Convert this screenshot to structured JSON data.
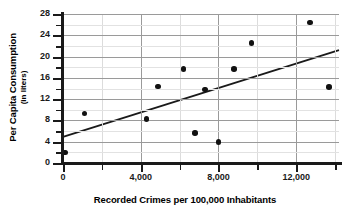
{
  "chart_data": {
    "type": "scatter",
    "title": "",
    "xlabel": "Recorded Crimes per 100,000 Inhabitants",
    "ylabel": "Per Capita Consumption",
    "ylabel_sub": "(in liters)",
    "xlim": [
      0,
      14200
    ],
    "ylim": [
      0,
      28
    ],
    "xticks": [
      0,
      4000,
      8000,
      12000
    ],
    "xtick_labels": [
      "0",
      "4,000",
      "8,000",
      "12,000"
    ],
    "xminor_ticks": [
      2000,
      6000,
      10000,
      14000
    ],
    "yticks": [
      0,
      4,
      8,
      12,
      16,
      20,
      24,
      28
    ],
    "ytick_labels": [
      "0",
      "4",
      "8",
      "12",
      "16",
      "20",
      "24",
      "28"
    ],
    "yminor_ticks": [
      2,
      6,
      10,
      14,
      18,
      22,
      26
    ],
    "grid": true,
    "legend": "none",
    "marker_color": "#111111",
    "grid_color": "#c9c9c9",
    "axis_color": "#1a1a1a",
    "points": [
      {
        "x": 100,
        "y": 2.0
      },
      {
        "x": 1100,
        "y": 9.3
      },
      {
        "x": 4300,
        "y": 8.3
      },
      {
        "x": 4900,
        "y": 14.4
      },
      {
        "x": 6200,
        "y": 17.7
      },
      {
        "x": 6800,
        "y": 5.6
      },
      {
        "x": 7300,
        "y": 13.8
      },
      {
        "x": 8000,
        "y": 3.9
      },
      {
        "x": 8800,
        "y": 17.7
      },
      {
        "x": 9700,
        "y": 22.6
      },
      {
        "x": 12700,
        "y": 26.4
      },
      {
        "x": 13700,
        "y": 14.3
      }
    ],
    "series": [
      {
        "name": "observations",
        "type": "scatter",
        "x": [
          100,
          1100,
          4300,
          4900,
          6200,
          6800,
          7300,
          8000,
          8800,
          9700,
          12700,
          13700
        ],
        "values": [
          2.0,
          9.3,
          8.3,
          14.4,
          17.7,
          5.6,
          13.8,
          3.9,
          17.7,
          22.6,
          26.4,
          14.3
        ]
      },
      {
        "name": "trend line",
        "type": "line",
        "x": [
          0,
          14200
        ],
        "values": [
          4.9,
          21.2
        ]
      }
    ],
    "trendline": {
      "x_start": 0,
      "y_start": 4.9,
      "x_end": 14200,
      "y_end": 21.2,
      "color": "#1a1a1a",
      "width": 1.8
    }
  }
}
